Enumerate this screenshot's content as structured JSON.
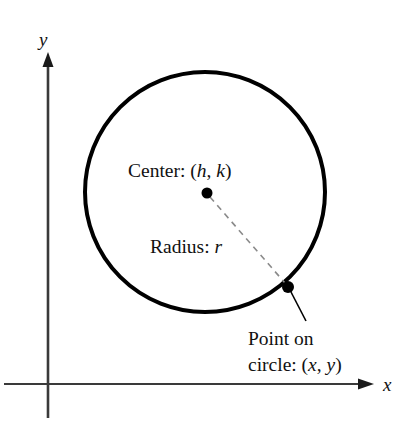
{
  "figure": {
    "background_color": "#ffffff",
    "stroke_color": "#000000",
    "dashed_color": "#8a8a8a",
    "axis_color": "#3a3a3a"
  },
  "axes": {
    "x_label": "x",
    "y_label": "y",
    "origin": {
      "x": 48,
      "y": 384
    },
    "x_axis": {
      "start_x": 4,
      "end_x": 374,
      "y": 384,
      "arrow": "right"
    },
    "y_axis": {
      "x": 48,
      "start_y": 418,
      "end_y": 52,
      "arrow": "up"
    },
    "x_label_pos": {
      "x": 383,
      "y": 391
    },
    "y_label_pos": {
      "x": 39,
      "y": 46
    }
  },
  "circle": {
    "center_x": 205,
    "center_y": 192,
    "radius": 120,
    "stroke_width": 4
  },
  "points": [
    {
      "name": "center-point",
      "x": 207,
      "y": 193,
      "dot_radius": 5.5
    },
    {
      "name": "point-on-circle",
      "x": 288,
      "y": 287,
      "dot_radius": 6
    }
  ],
  "radius_line": {
    "from": {
      "x": 210,
      "y": 197
    },
    "to": {
      "x": 285,
      "y": 283
    },
    "dash": "6 5",
    "width": 1.6
  },
  "leader_line": {
    "from": {
      "x": 291,
      "y": 292
    },
    "to": {
      "x": 306,
      "y": 321
    },
    "width": 1.6
  },
  "labels": {
    "center": {
      "prefix": "Center: (",
      "var1": "h",
      "separator": ", ",
      "var2": "k",
      "suffix": ")",
      "x": 128,
      "y": 177
    },
    "radius": {
      "prefix": "Radius: ",
      "var1": "r",
      "x": 150,
      "y": 253
    },
    "point": {
      "line1": "Point on",
      "line2_prefix": "circle: (",
      "line2_var1": "x",
      "line2_separator": ", ",
      "line2_var2": "y",
      "line2_suffix": ")",
      "x": 248,
      "y1": 345,
      "y2": 371
    }
  }
}
